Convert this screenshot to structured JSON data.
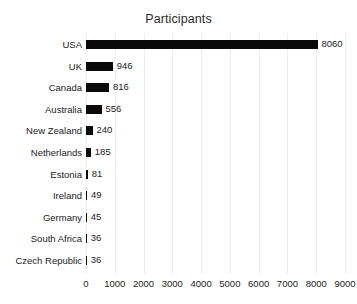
{
  "chart_data": {
    "type": "bar",
    "orientation": "horizontal",
    "title": "Participants",
    "xlabel": "",
    "ylabel": "",
    "categories": [
      "USA",
      "UK",
      "Canada",
      "Australia",
      "New Zealand",
      "Netherlands",
      "Estonia",
      "Ireland",
      "Germany",
      "South Africa",
      "Czech Republic"
    ],
    "values": [
      8060,
      946,
      816,
      556,
      240,
      185,
      81,
      49,
      45,
      36,
      36
    ],
    "data_labels": [
      "8060",
      "946",
      "816",
      "556",
      "240",
      "185",
      "81",
      "49",
      "45",
      "36",
      "36"
    ],
    "xlim": [
      0,
      9000
    ],
    "xticks": [
      0,
      1000,
      2000,
      3000,
      4000,
      5000,
      6000,
      7000,
      8000,
      9000
    ],
    "xtick_labels": [
      "0",
      "1000",
      "2000",
      "3000",
      "4000",
      "5000",
      "6000",
      "7000",
      "8000",
      "9000"
    ],
    "grid": "vertical",
    "legend": "none",
    "bar_color": "#0a0a0a",
    "grid_color": "#ededed",
    "background_color": "#ffffff",
    "text_color": "#1b1b1b"
  }
}
